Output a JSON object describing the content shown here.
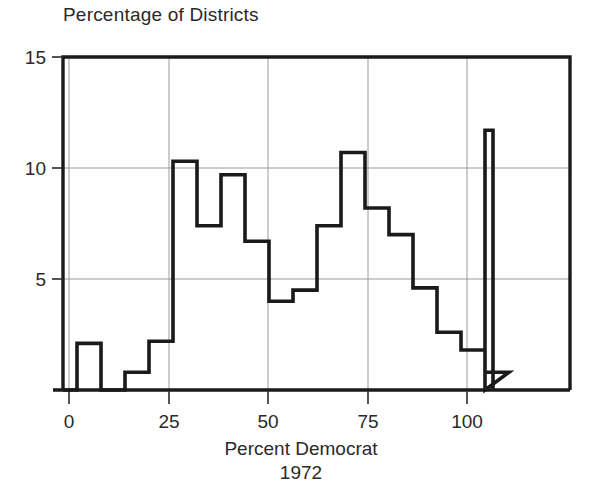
{
  "chart_data": {
    "type": "bar",
    "title": "Percentage of Districts",
    "xlabel_line1": "Percent Democrat",
    "xlabel_line2": "1972",
    "ylabel": "",
    "xlim": [
      -4,
      110
    ],
    "ylim": [
      0,
      15
    ],
    "grid": true,
    "legend": false,
    "bin_width": 6,
    "xticks": [
      0,
      25,
      50,
      75,
      100
    ],
    "xtick_labels": [
      "0",
      "25",
      "50",
      "75",
      "100"
    ],
    "yticks": [
      5,
      10,
      15
    ],
    "ytick_labels": [
      "5",
      "10",
      "15"
    ],
    "bin_edges": [
      -4,
      2,
      8,
      14,
      20,
      26,
      32,
      38,
      44,
      50,
      56,
      62,
      68,
      74,
      80,
      86,
      92,
      98,
      104,
      110
    ],
    "categories": [
      "-4–2",
      "2–8",
      "8–14",
      "14–20",
      "20–26",
      "26–32",
      "32–38",
      "38–44",
      "44–50",
      "50–56",
      "56–62",
      "62–68",
      "68–74",
      "74–80",
      "80–86",
      "86–92",
      "92–98",
      "98–104",
      "104–110"
    ],
    "values": [
      0,
      2.1,
      0,
      0.8,
      2.2,
      10.3,
      7.4,
      9.7,
      6.7,
      4.0,
      4.5,
      7.4,
      10.7,
      8.2,
      7.0,
      4.6,
      2.6,
      1.8,
      0.8
    ],
    "spike": {
      "x_start": 104,
      "x_end": 106,
      "value": 11.7
    },
    "series_color": "#1a1a1a",
    "grid_color": "#9a9a9a",
    "axis_color": "#1a1a1a"
  },
  "figure": {
    "title": "Percentage of Districts",
    "xlabel_line1": "Percent Democrat",
    "xlabel_line2": "1972"
  },
  "axis": {
    "y_labels": [
      "15",
      "10",
      "5"
    ],
    "x_labels": [
      "0",
      "25",
      "50",
      "75",
      "100"
    ]
  }
}
